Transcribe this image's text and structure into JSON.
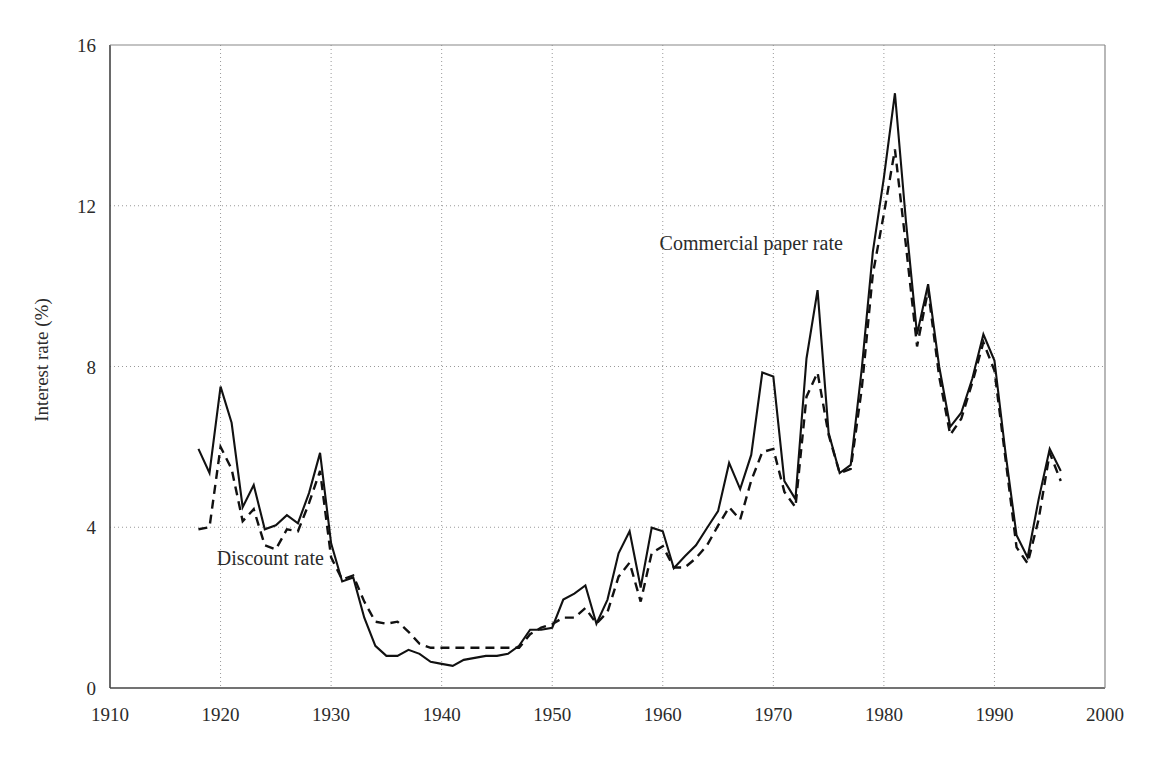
{
  "chart_data": {
    "type": "line",
    "title": "",
    "subtitle": "",
    "xlabel": "",
    "ylabel": "Interest rate (%)",
    "xlim": [
      1910,
      2000
    ],
    "ylim": [
      0,
      16
    ],
    "xticks": [
      1910,
      1920,
      1930,
      1940,
      1950,
      1960,
      1970,
      1980,
      1990,
      2000
    ],
    "yticks": [
      0,
      4,
      8,
      12,
      16
    ],
    "grid": "dotted-both",
    "legend_position": "inline-annotations",
    "annotations": [
      {
        "text": "Commercial paper rate",
        "x": 1968.0,
        "y": 10.9
      },
      {
        "text": "Discount rate",
        "x": 1924.5,
        "y": 3.05
      }
    ],
    "x": [
      1918,
      1919,
      1920,
      1921,
      1922,
      1923,
      1924,
      1925,
      1926,
      1927,
      1928,
      1929,
      1930,
      1931,
      1932,
      1933,
      1934,
      1935,
      1936,
      1937,
      1938,
      1939,
      1940,
      1941,
      1942,
      1943,
      1944,
      1945,
      1946,
      1947,
      1948,
      1949,
      1950,
      1951,
      1952,
      1953,
      1954,
      1955,
      1956,
      1957,
      1958,
      1959,
      1960,
      1961,
      1962,
      1963,
      1964,
      1965,
      1966,
      1967,
      1968,
      1969,
      1970,
      1971,
      1972,
      1973,
      1974,
      1975,
      1976,
      1977,
      1978,
      1979,
      1980,
      1981,
      1982,
      1983,
      1984,
      1985,
      1986,
      1987,
      1988,
      1989,
      1990,
      1991,
      1992,
      1993,
      1994,
      1995,
      1996
    ],
    "series": [
      {
        "name": "Commercial paper rate",
        "style": "solid",
        "color": "#111111",
        "values": [
          5.95,
          5.35,
          7.5,
          6.6,
          4.5,
          5.05,
          3.95,
          4.05,
          4.3,
          4.1,
          4.85,
          5.85,
          3.6,
          2.65,
          2.75,
          1.75,
          1.05,
          0.8,
          0.8,
          0.95,
          0.85,
          0.65,
          0.6,
          0.55,
          0.7,
          0.75,
          0.8,
          0.8,
          0.85,
          1.05,
          1.45,
          1.45,
          1.5,
          2.2,
          2.35,
          2.55,
          1.6,
          2.2,
          3.35,
          3.9,
          2.5,
          3.99,
          3.9,
          2.98,
          3.28,
          3.55,
          3.98,
          4.4,
          5.6,
          4.95,
          5.8,
          7.85,
          7.75,
          5.15,
          4.7,
          8.2,
          9.9,
          6.35,
          5.35,
          5.55,
          7.95,
          10.85,
          12.7,
          14.8,
          11.6,
          8.8,
          10.05,
          8.0,
          6.5,
          6.85,
          7.7,
          8.8,
          8.15,
          5.85,
          3.8,
          3.25,
          4.7,
          5.95,
          5.4
        ]
      },
      {
        "name": "Discount rate",
        "style": "dashed",
        "color": "#111111",
        "values": [
          3.95,
          4.0,
          6.0,
          5.45,
          4.15,
          4.45,
          3.55,
          3.45,
          3.95,
          3.9,
          4.6,
          5.4,
          3.25,
          2.7,
          2.8,
          2.15,
          1.65,
          1.6,
          1.65,
          1.4,
          1.1,
          1.0,
          1.0,
          1.0,
          1.0,
          1.0,
          1.0,
          1.0,
          1.0,
          1.0,
          1.34,
          1.5,
          1.59,
          1.75,
          1.75,
          1.99,
          1.6,
          1.89,
          2.77,
          3.12,
          2.15,
          3.36,
          3.53,
          3.0,
          3.0,
          3.23,
          3.55,
          4.04,
          4.5,
          4.19,
          5.16,
          5.87,
          5.95,
          4.88,
          4.5,
          7.25,
          7.85,
          6.3,
          5.35,
          5.45,
          7.45,
          10.3,
          11.8,
          13.4,
          11.0,
          8.5,
          9.9,
          7.75,
          6.3,
          6.7,
          7.6,
          8.6,
          7.9,
          5.7,
          3.5,
          3.1,
          4.2,
          5.85,
          5.15
        ]
      }
    ]
  },
  "axis": {
    "y_title": "Interest rate (%)",
    "y_tick_labels": [
      "0",
      "4",
      "8",
      "12",
      "16"
    ],
    "x_tick_labels": [
      "1910",
      "1920",
      "1930",
      "1940",
      "1950",
      "1960",
      "1970",
      "1980",
      "1990",
      "2000"
    ]
  },
  "labels": {
    "commercial_paper": "Commercial paper rate",
    "discount": "Discount rate"
  }
}
